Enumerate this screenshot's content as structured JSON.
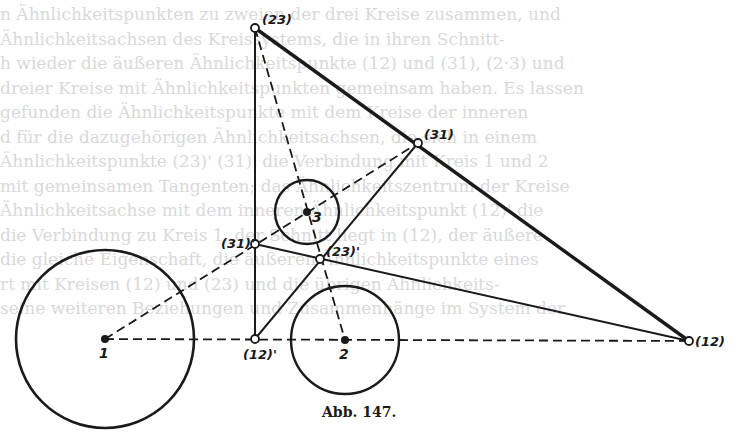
{
  "figure": {
    "caption": "Abb. 147.",
    "labels": {
      "p23": "(23)",
      "p31": "(31)",
      "p31p": "(31)'",
      "p23p": "(23)'",
      "p12p": "(12)'",
      "p12": "(12)",
      "c1": "1",
      "c2": "2",
      "c3": "3"
    },
    "points": {
      "p23": {
        "x": 255,
        "y": 28
      },
      "p31": {
        "x": 418,
        "y": 143
      },
      "p31p": {
        "x": 255,
        "y": 244
      },
      "p23p": {
        "x": 320,
        "y": 259
      },
      "p12p": {
        "x": 255,
        "y": 339
      },
      "p12": {
        "x": 689,
        "y": 341
      }
    },
    "circles": [
      {
        "name": "1",
        "cx": 105,
        "cy": 339,
        "r": 89
      },
      {
        "name": "2",
        "cx": 345,
        "cy": 340,
        "r": 54
      },
      {
        "name": "3",
        "cx": 307,
        "cy": 212,
        "r": 32
      }
    ]
  },
  "bleed_text": [
    "n Ähnlichkeitspunkten zu zweien der drei Kreise zusammen, und",
    "Ähnlichkeitsachsen des Kreissystems, die in ihren Schnitt-",
    "h wieder die äußeren Ähnlichkeitspunkte (12) und (31), (2·3) und",
    "dreier Kreise mit Ähnlichkeitspunkten gemeinsam haben. Es lassen",
    "gefunden die Ähnlichkeitspunkte mit dem Kreise der inneren",
    "d für die dazugehörigen Ähnlichkeitsachsen, die sich in einem",
    "Ähnlichkeitspunkte (23)' (31)' die Verbindung mit Kreis 1 und 2",
    "mit gemeinsamen Tangenten; das Ähnlichkeitszentrum der Kreise",
    "Ähnlichkeitsachse mit dem inneren Ähnlichkeitspunkt (12)' die",
    "die Verbindung zu Kreis 1, der Schnitt liegt in (12), der äußere",
    "die gleiche Eigenschaft, die äußeren Ähnlichkeitspunkte eines",
    "rt mit Kreisen (12) und (23) und die übrigen Ähnlichkeits-",
    "seine weiteren Beziehungen und Zusammenhänge im System der"
  ]
}
